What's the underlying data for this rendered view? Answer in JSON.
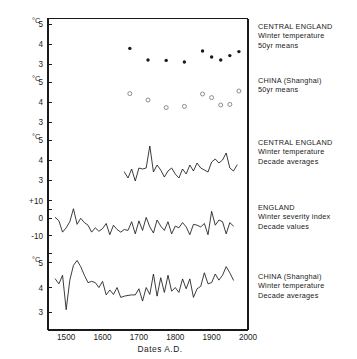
{
  "figure": {
    "xaxis_title": "Dates  A.D.",
    "x_ticks": [
      "1500",
      "1600",
      "1700",
      "1800",
      "1900",
      "2000"
    ],
    "unit_label": "°C",
    "panels": [
      {
        "id": "central-england-50yr",
        "legend": [
          "CENTRAL ENGLAND",
          "Winter temperature",
          "50yr means"
        ],
        "unit": "°C",
        "y_ticks": [
          "5",
          "4",
          "3"
        ]
      },
      {
        "id": "china-shanghai-50yr",
        "legend": [
          "CHINA (Shanghai)",
          "50yr means"
        ],
        "unit": "°C",
        "y_ticks": [
          "5",
          "4",
          "3"
        ]
      },
      {
        "id": "central-england-decade",
        "legend": [
          "CENTRAL ENGLAND",
          "Winter temperature",
          "Decade averages"
        ],
        "unit": "°C",
        "y_ticks": [
          "5",
          "4",
          "3"
        ]
      },
      {
        "id": "england-severity-index",
        "legend": [
          "ENGLAND",
          "Winter severity index",
          "Decade values"
        ],
        "unit": "",
        "y_ticks": [
          "+10",
          "0",
          "-10"
        ]
      },
      {
        "id": "china-shanghai-decade",
        "legend": [
          "CHINA (Shanghai)",
          "Winter temperature",
          "Decade averages"
        ],
        "unit": "°C",
        "y_ticks": [
          "5",
          "4",
          "3"
        ]
      }
    ]
  },
  "chart_data": [
    {
      "type": "scatter",
      "id": "central-england-50yr",
      "title": "CENTRAL ENGLAND Winter temperature 50yr means",
      "xlabel": "Dates A.D.",
      "ylabel": "°C",
      "xlim": [
        1450,
        2000
      ],
      "ylim": [
        2.6,
        5.2
      ],
      "yticks": [
        3,
        4,
        5
      ],
      "marker": "filled-circle",
      "x": [
        1675,
        1725,
        1775,
        1825,
        1875,
        1900,
        1925,
        1950,
        1975
      ],
      "y": [
        3.78,
        3.2,
        3.18,
        3.1,
        3.65,
        3.35,
        3.2,
        3.42,
        3.62
      ]
    },
    {
      "type": "scatter",
      "id": "china-shanghai-50yr",
      "title": "CHINA (Shanghai) 50yr means",
      "xlabel": "Dates A.D.",
      "ylabel": "°C",
      "xlim": [
        1450,
        2000
      ],
      "ylim": [
        2.6,
        5.2
      ],
      "yticks": [
        3,
        4,
        5
      ],
      "marker": "open-circle",
      "x": [
        1675,
        1725,
        1775,
        1825,
        1875,
        1900,
        1925,
        1950,
        1975
      ],
      "y": [
        4.42,
        4.1,
        3.72,
        3.78,
        4.4,
        4.22,
        3.85,
        3.88,
        4.55
      ]
    },
    {
      "type": "line",
      "id": "central-england-decade",
      "title": "CENTRAL ENGLAND Winter temperature Decade averages",
      "xlabel": "Dates A.D.",
      "ylabel": "°C",
      "xlim": [
        1450,
        2000
      ],
      "ylim": [
        2.6,
        5.2
      ],
      "yticks": [
        3,
        4,
        5
      ],
      "x": [
        1660,
        1670,
        1680,
        1690,
        1700,
        1710,
        1720,
        1730,
        1740,
        1750,
        1760,
        1770,
        1780,
        1790,
        1800,
        1810,
        1820,
        1830,
        1840,
        1850,
        1860,
        1870,
        1880,
        1890,
        1900,
        1910,
        1920,
        1930,
        1940,
        1950,
        1960,
        1970
      ],
      "y": [
        3.4,
        3.1,
        3.55,
        2.95,
        3.6,
        3.55,
        3.6,
        4.7,
        3.4,
        3.75,
        3.5,
        3.15,
        3.45,
        3.6,
        3.3,
        3.1,
        3.55,
        3.3,
        3.75,
        3.45,
        3.85,
        3.6,
        3.5,
        3.4,
        3.9,
        4.05,
        3.85,
        4.0,
        4.35,
        3.6,
        3.45,
        3.75
      ]
    },
    {
      "type": "line",
      "id": "england-severity-index",
      "title": "ENGLAND Winter severity index Decade values",
      "xlabel": "Dates A.D.",
      "ylabel": "index",
      "xlim": [
        1450,
        2000
      ],
      "ylim": [
        -16,
        14
      ],
      "yticks": [
        -10,
        0,
        10
      ],
      "x": [
        1470,
        1480,
        1490,
        1500,
        1510,
        1520,
        1530,
        1540,
        1550,
        1560,
        1570,
        1580,
        1590,
        1600,
        1610,
        1620,
        1630,
        1640,
        1650,
        1660,
        1670,
        1680,
        1690,
        1700,
        1710,
        1720,
        1730,
        1740,
        1750,
        1760,
        1770,
        1780,
        1790,
        1800,
        1810,
        1820,
        1830,
        1840,
        1850,
        1860,
        1870,
        1880,
        1890,
        1900,
        1910,
        1920,
        1930,
        1940,
        1950,
        1960
      ],
      "y": [
        0.5,
        -1.5,
        -8.0,
        -5.5,
        -2.0,
        5.5,
        -3.5,
        0.0,
        -2.5,
        -4.0,
        -8.0,
        -5.5,
        -7.5,
        -6.0,
        -3.0,
        -9.5,
        -4.0,
        -6.5,
        -8.0,
        -6.5,
        -7.0,
        -2.0,
        -9.0,
        -1.5,
        -7.0,
        0.5,
        -5.0,
        -8.5,
        -1.0,
        -4.5,
        -7.0,
        -2.0,
        -9.0,
        -4.5,
        -5.5,
        -2.5,
        -5.0,
        -9.5,
        -3.5,
        -4.0,
        -5.0,
        -3.0,
        -9.5,
        4.0,
        -4.0,
        -1.0,
        -2.0,
        -9.0,
        -2.5,
        -4.5
      ]
    },
    {
      "type": "line",
      "id": "china-shanghai-decade",
      "title": "CHINA (Shanghai) Winter temperature Decade averages",
      "xlabel": "Dates A.D.",
      "ylabel": "°C",
      "xlim": [
        1450,
        2000
      ],
      "ylim": [
        2.6,
        5.2
      ],
      "yticks": [
        3,
        4,
        5
      ],
      "x": [
        1470,
        1480,
        1490,
        1500,
        1510,
        1520,
        1530,
        1540,
        1550,
        1560,
        1570,
        1580,
        1590,
        1600,
        1610,
        1620,
        1630,
        1640,
        1650,
        1660,
        1670,
        1680,
        1690,
        1700,
        1710,
        1720,
        1730,
        1740,
        1750,
        1760,
        1770,
        1780,
        1790,
        1800,
        1810,
        1820,
        1830,
        1840,
        1850,
        1860,
        1870,
        1880,
        1890,
        1900,
        1910,
        1920,
        1930,
        1940,
        1950,
        1960
      ],
      "y": [
        4.35,
        4.15,
        4.5,
        3.1,
        4.3,
        4.9,
        5.1,
        4.85,
        4.5,
        4.2,
        4.25,
        4.2,
        4.0,
        4.25,
        3.7,
        3.9,
        3.72,
        4.0,
        3.6,
        3.65,
        3.68,
        3.7,
        3.7,
        3.95,
        3.45,
        4.0,
        3.72,
        4.55,
        3.65,
        4.4,
        3.8,
        4.5,
        3.85,
        4.0,
        3.8,
        4.35,
        3.95,
        4.35,
        3.6,
        3.95,
        4.05,
        4.6,
        4.15,
        4.2,
        4.55,
        4.3,
        4.5,
        4.85,
        4.6,
        4.3
      ]
    }
  ]
}
